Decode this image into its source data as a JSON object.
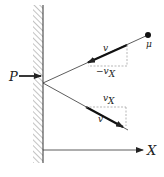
{
  "diagram": {
    "labels": {
      "force": "P",
      "mass": "μ",
      "incoming_velocity": "v",
      "incoming_component": "−v",
      "incoming_component_sub": "X",
      "outgoing_component": "v",
      "outgoing_component_sub": "X",
      "outgoing_velocity": "v",
      "axis": "X"
    },
    "colors": {
      "ink": "#222222",
      "hatch": "#777777",
      "dashed": "#888888"
    }
  }
}
